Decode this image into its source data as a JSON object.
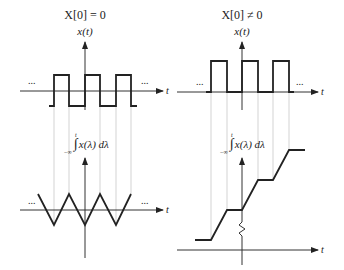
{
  "left_panel": {
    "title": "X[0] = 0",
    "top_ylabel": "x(t)",
    "top_xlabel": "t",
    "bottom_ylabel": "x(λ) dλ",
    "integral_upper": "t",
    "integral_lower": "−∞",
    "bottom_xlabel": "t",
    "ellipsis": "...",
    "top_signal": "square wave, zero mean",
    "bottom_signal": "triangle wave"
  },
  "right_panel": {
    "title": "X[0] ≠ 0",
    "top_ylabel": "x(t)",
    "top_xlabel": "t",
    "bottom_ylabel": "x(λ) dλ",
    "integral_upper": "t",
    "integral_lower": "−∞",
    "bottom_xlabel": "t",
    "ellipsis": "...",
    "top_signal": "pulse train, nonzero mean",
    "bottom_signal": "rising staircase ramp"
  },
  "colors": {
    "signal": "#222222",
    "guide": "#c8c8c8",
    "background": "#ffffff"
  }
}
